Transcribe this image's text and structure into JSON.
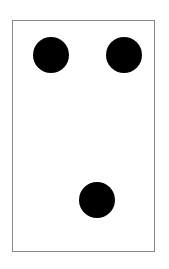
{
  "card": {
    "border_color": "#8a8a8a",
    "background": "#ffffff",
    "pip_count": 3,
    "pips": [
      {
        "name": "top-left",
        "cx": 50,
        "cy": 55,
        "r": 18,
        "color": "#000000"
      },
      {
        "name": "top-right",
        "cx": 123,
        "cy": 55,
        "r": 18,
        "color": "#000000"
      },
      {
        "name": "bottom-center",
        "cx": 96,
        "cy": 200,
        "r": 18,
        "color": "#000000"
      }
    ]
  }
}
